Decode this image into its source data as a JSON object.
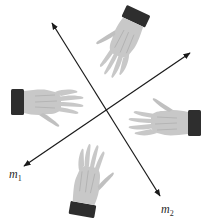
{
  "figure": {
    "type": "reflection-lines-diagram",
    "top_fragment_text": "",
    "lines": [
      {
        "id": "m1",
        "label_letter": "m",
        "label_subscript": "1",
        "from": [
          24,
          166
        ],
        "to": [
          190,
          53
        ],
        "arrows": "both"
      },
      {
        "id": "m2",
        "label_letter": "m",
        "label_subscript": "2",
        "from": [
          52,
          23
        ],
        "to": [
          160,
          196
        ],
        "arrows": "both"
      }
    ],
    "intersection": [
      105,
      112
    ],
    "hands": [
      {
        "id": "hand-top",
        "position": "top",
        "fingers_pointing": "down-left",
        "cuff_position": "top-right"
      },
      {
        "id": "hand-left",
        "position": "left",
        "fingers_pointing": "right",
        "cuff_position": "left"
      },
      {
        "id": "hand-right",
        "position": "right",
        "fingers_pointing": "left",
        "cuff_position": "right"
      },
      {
        "id": "hand-bottom",
        "position": "bottom",
        "fingers_pointing": "up",
        "cuff_position": "bottom-left"
      }
    ],
    "colors": {
      "line": "#1a1a1a",
      "hand_fill": "#c8c8c8",
      "hand_shade": "#a8a8a8",
      "cuff": "#2e2e2e",
      "label": "#2a2a2a"
    }
  }
}
